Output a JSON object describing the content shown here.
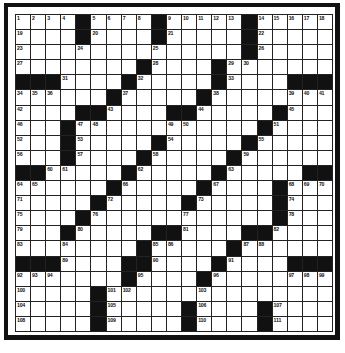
{
  "puzzle": {
    "type": "crossword",
    "size": {
      "rows": 21,
      "cols": 21
    },
    "legend": {
      "B": "black square",
      "0": "white square (no number)"
    },
    "colors": {
      "ink": "#111111",
      "paper": "#ffffff"
    },
    "grid": [
      [
        "1",
        "2",
        "3",
        "4",
        "B",
        "5",
        "6",
        "7",
        "8",
        "B",
        "9",
        "10",
        "11",
        "12",
        "13",
        "B",
        "14",
        "15",
        "16",
        "17",
        "18"
      ],
      [
        "19",
        "0",
        "0",
        "0",
        "B",
        "20",
        "0",
        "0",
        "0",
        "B",
        "21",
        "0",
        "0",
        "0",
        "0",
        "B",
        "22",
        "0",
        "0",
        "0",
        "0"
      ],
      [
        "23",
        "0",
        "0",
        "0",
        "24",
        "0",
        "0",
        "0",
        "0",
        "25",
        "0",
        "0",
        "0",
        "0",
        "0",
        "B",
        "26",
        "0",
        "0",
        "0",
        "0"
      ],
      [
        "27",
        "0",
        "0",
        "0",
        "0",
        "0",
        "0",
        "0",
        "B",
        "28",
        "0",
        "0",
        "0",
        "B",
        "29",
        "30",
        "0",
        "0",
        "0",
        "0",
        "0"
      ],
      [
        "B",
        "B",
        "B",
        "31",
        "0",
        "0",
        "0",
        "B",
        "32",
        "0",
        "0",
        "0",
        "0",
        "B",
        "33",
        "0",
        "0",
        "0",
        "B",
        "B",
        "B"
      ],
      [
        "34",
        "35",
        "36",
        "0",
        "0",
        "0",
        "B",
        "37",
        "0",
        "0",
        "0",
        "0",
        "B",
        "38",
        "0",
        "0",
        "0",
        "0",
        "39",
        "40",
        "41"
      ],
      [
        "42",
        "0",
        "0",
        "0",
        "B",
        "B",
        "43",
        "0",
        "0",
        "0",
        "B",
        "B",
        "44",
        "0",
        "0",
        "0",
        "0",
        "B",
        "45",
        "0",
        "0"
      ],
      [
        "46",
        "0",
        "0",
        "B",
        "47",
        "48",
        "0",
        "0",
        "0",
        "0",
        "49",
        "50",
        "0",
        "0",
        "0",
        "0",
        "B",
        "51",
        "0",
        "0",
        "0"
      ],
      [
        "52",
        "0",
        "0",
        "B",
        "53",
        "0",
        "0",
        "0",
        "0",
        "B",
        "54",
        "0",
        "0",
        "0",
        "0",
        "B",
        "55",
        "0",
        "0",
        "0",
        "0"
      ],
      [
        "56",
        "0",
        "0",
        "B",
        "57",
        "0",
        "0",
        "0",
        "B",
        "58",
        "0",
        "0",
        "0",
        "0",
        "B",
        "59",
        "0",
        "0",
        "0",
        "0",
        "0"
      ],
      [
        "B",
        "B",
        "60",
        "61",
        "0",
        "0",
        "0",
        "B",
        "62",
        "0",
        "0",
        "0",
        "0",
        "B",
        "63",
        "0",
        "0",
        "0",
        "0",
        "B",
        "B"
      ],
      [
        "64",
        "65",
        "0",
        "0",
        "0",
        "0",
        "B",
        "66",
        "0",
        "0",
        "0",
        "0",
        "B",
        "67",
        "0",
        "0",
        "0",
        "B",
        "68",
        "69",
        "70"
      ],
      [
        "71",
        "0",
        "0",
        "0",
        "0",
        "B",
        "72",
        "0",
        "0",
        "0",
        "0",
        "B",
        "73",
        "0",
        "0",
        "0",
        "0",
        "B",
        "74",
        "0",
        "0"
      ],
      [
        "75",
        "0",
        "0",
        "0",
        "B",
        "76",
        "0",
        "0",
        "0",
        "0",
        "0",
        "77",
        "0",
        "0",
        "0",
        "0",
        "0",
        "B",
        "78",
        "0",
        "0"
      ],
      [
        "79",
        "0",
        "0",
        "B",
        "80",
        "0",
        "0",
        "0",
        "0",
        "B",
        "B",
        "81",
        "0",
        "0",
        "0",
        "B",
        "B",
        "82",
        "0",
        "0",
        "0"
      ],
      [
        "83",
        "0",
        "0",
        "84",
        "0",
        "0",
        "0",
        "0",
        "B",
        "85",
        "86",
        "0",
        "0",
        "0",
        "B",
        "87",
        "88",
        "0",
        "0",
        "0",
        "0"
      ],
      [
        "B",
        "B",
        "B",
        "89",
        "0",
        "0",
        "0",
        "B",
        "B",
        "90",
        "0",
        "0",
        "0",
        "B",
        "91",
        "0",
        "0",
        "0",
        "B",
        "B",
        "B"
      ],
      [
        "92",
        "93",
        "94",
        "0",
        "0",
        "0",
        "0",
        "B",
        "95",
        "0",
        "0",
        "0",
        "B",
        "96",
        "0",
        "0",
        "0",
        "0",
        "97",
        "98",
        "99"
      ],
      [
        "100",
        "0",
        "0",
        "0",
        "0",
        "B",
        "101",
        "102",
        "0",
        "0",
        "0",
        "0",
        "103",
        "0",
        "0",
        "0",
        "0",
        "0",
        "0",
        "0",
        "0"
      ],
      [
        "104",
        "0",
        "0",
        "0",
        "0",
        "B",
        "105",
        "0",
        "0",
        "0",
        "0",
        "B",
        "106",
        "0",
        "0",
        "0",
        "B",
        "107",
        "0",
        "0",
        "0"
      ],
      [
        "108",
        "0",
        "0",
        "0",
        "0",
        "B",
        "109",
        "0",
        "0",
        "0",
        "0",
        "B",
        "110",
        "0",
        "0",
        "0",
        "B",
        "111",
        "0",
        "0",
        "0"
      ]
    ]
  }
}
